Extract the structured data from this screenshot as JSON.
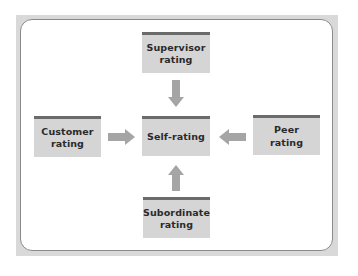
{
  "diagram": {
    "title": "",
    "type": "360-degree feedback",
    "colors": {
      "frame": "#d9d9d9",
      "panel_border": "#8a8a8a",
      "box_fill": "#d5d5d5",
      "box_top_bar": "#6b6b6b",
      "arrow": "#a5a5a5",
      "text": "#2a2a2a"
    },
    "center": {
      "label": "Self-rating"
    },
    "sources": {
      "top": {
        "label": "Supervisor\nrating",
        "arrow_direction": "down"
      },
      "left": {
        "label": "Customer\nrating",
        "arrow_direction": "right"
      },
      "right": {
        "label": "Peer\nrating",
        "arrow_direction": "left"
      },
      "bottom": {
        "label": "Subordinate\nrating",
        "arrow_direction": "up"
      }
    },
    "edges": [
      {
        "from": "Supervisor rating",
        "to": "Self-rating"
      },
      {
        "from": "Customer rating",
        "to": "Self-rating"
      },
      {
        "from": "Peer rating",
        "to": "Self-rating"
      },
      {
        "from": "Subordinate rating",
        "to": "Self-rating"
      }
    ]
  }
}
